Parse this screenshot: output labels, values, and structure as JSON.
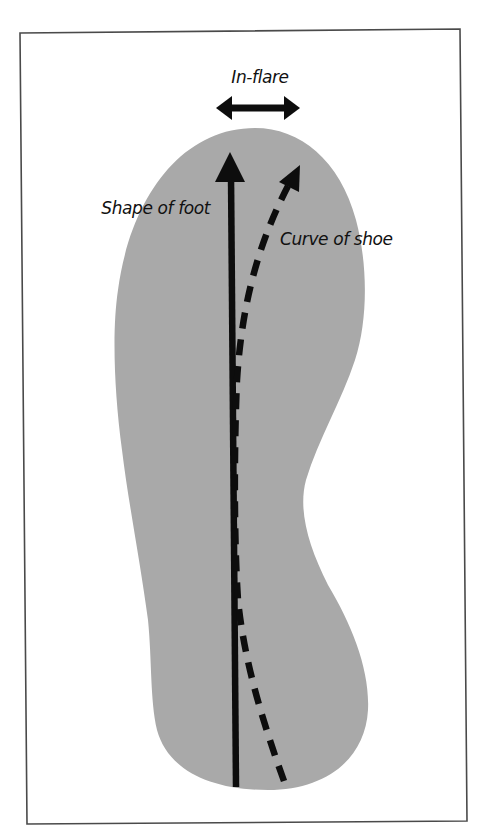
{
  "diagram": {
    "labels": {
      "in_flare": "In-flare",
      "shape_of_foot": "Shape of foot",
      "curve_of_shoe": "Curve of shoe"
    },
    "colors": {
      "foot_fill": "#a9a9a9",
      "arrow": "#0d0d0d",
      "frame": "#4a4a4a",
      "background": "#ffffff"
    },
    "elements": [
      {
        "name": "foot-outline",
        "type": "shape",
        "description": "Gray foot/insole silhouette"
      },
      {
        "name": "shape-of-foot-arrow",
        "type": "solid-arrow",
        "direction": "up"
      },
      {
        "name": "curve-of-shoe-arrow",
        "type": "dashed-arrow",
        "direction": "up-right"
      },
      {
        "name": "in-flare-arrow",
        "type": "double-headed-arrow",
        "direction": "horizontal"
      }
    ]
  }
}
